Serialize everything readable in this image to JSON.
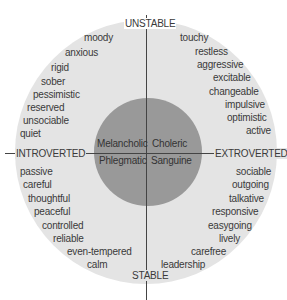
{
  "diagram": {
    "axes": {
      "top": "UNSTABLE",
      "bottom": "STABLE",
      "left": "INTROVERTED",
      "right": "EXTROVERTED"
    },
    "temperaments": {
      "upper_left": "Melancholic",
      "upper_right": "Choleric",
      "lower_left": "Phlegmatic",
      "lower_right": "Sanguine"
    },
    "quadrants": {
      "upper_left": [
        "moody",
        "anxious",
        "rigid",
        "sober",
        "pessimistic",
        "reserved",
        "unsociable",
        "quiet"
      ],
      "upper_right": [
        "touchy",
        "restless",
        "aggressive",
        "excitable",
        "changeable",
        "impulsive",
        "optimistic",
        "active"
      ],
      "lower_left": [
        "passive",
        "careful",
        "thoughtful",
        "peaceful",
        "controlled",
        "reliable",
        "even-tempered",
        "calm"
      ],
      "lower_right": [
        "sociable",
        "outgoing",
        "talkative",
        "responsive",
        "easygoing",
        "lively",
        "carefree",
        "leadership"
      ]
    },
    "colors": {
      "outer_circle": "#e4e4e4",
      "inner_circle": "#999999",
      "axis_lines": "#444444",
      "text": "#3a3a3a"
    }
  }
}
